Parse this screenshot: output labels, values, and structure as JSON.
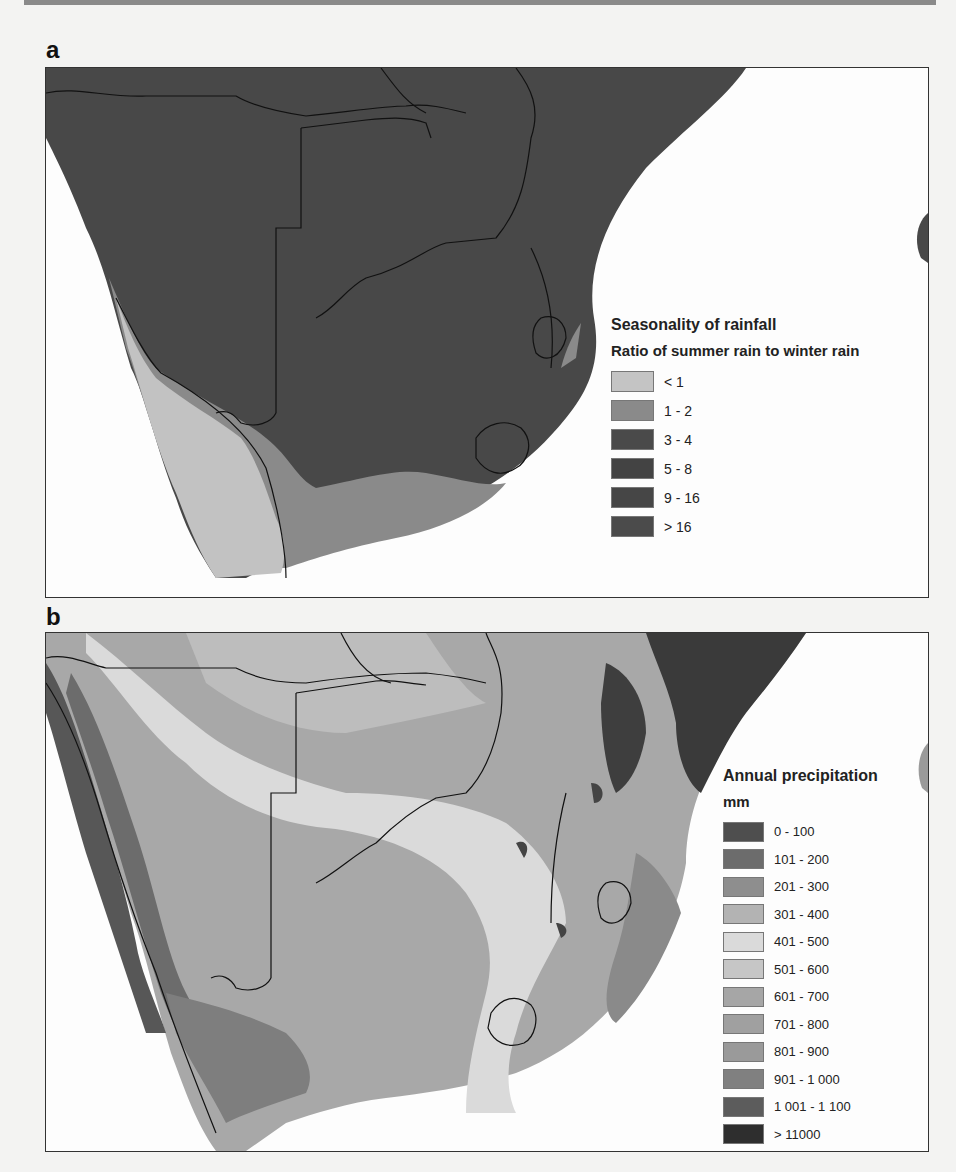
{
  "figure": {
    "panels": [
      {
        "id": "a",
        "label": "a",
        "legend": {
          "title": "Seasonality of rainfall",
          "subtitle": "Ratio of summer rain to winter rain",
          "classes": [
            {
              "label": "< 1",
              "color": "#c4c4c4"
            },
            {
              "label": "1 - 2",
              "color": "#8a8a8a"
            },
            {
              "label": "3 - 4",
              "color": "#4a4a4a"
            },
            {
              "label": "5 - 8",
              "color": "#434343"
            },
            {
              "label": "9 - 16",
              "color": "#464646"
            },
            {
              "label": "> 16",
              "color": "#4b4b4b"
            }
          ]
        }
      },
      {
        "id": "b",
        "label": "b",
        "legend": {
          "title": "Annual precipitation",
          "subtitle": "mm",
          "classes": [
            {
              "label": "0 - 100",
              "color": "#4e4e4e"
            },
            {
              "label": "101 - 200",
              "color": "#6c6c6c"
            },
            {
              "label": "201 - 300",
              "color": "#8e8e8e"
            },
            {
              "label": "301 - 400",
              "color": "#b3b3b3"
            },
            {
              "label": "401 - 500",
              "color": "#dadada"
            },
            {
              "label": "501 - 600",
              "color": "#c6c6c6"
            },
            {
              "label": "601 - 700",
              "color": "#a6a6a6"
            },
            {
              "label": "701 - 800",
              "color": "#a0a0a0"
            },
            {
              "label": "801 - 900",
              "color": "#9a9a9a"
            },
            {
              "label": "901 - 1 000",
              "color": "#808080"
            },
            {
              "label": "1 001 - 1 100",
              "color": "#5c5c5c"
            },
            {
              "label": "> 11000",
              "color": "#2e2e2e"
            }
          ]
        }
      }
    ]
  }
}
